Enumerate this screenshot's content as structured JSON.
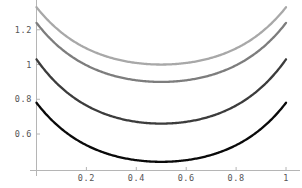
{
  "chart_data": {
    "type": "line",
    "title": "",
    "subtitle": "",
    "xlabel": "",
    "ylabel": "",
    "xlim": [
      0,
      1.04
    ],
    "ylim": [
      0.39,
      1.36
    ],
    "grid": false,
    "legend": null,
    "x_ticks": [
      0.2,
      0.4,
      0.6,
      0.8,
      1
    ],
    "x_tick_labels": [
      "0.2",
      "0.4",
      "0.6",
      "0.8",
      "1"
    ],
    "y_ticks": [
      0.6,
      0.8,
      1,
      1.2
    ],
    "y_tick_labels": [
      "0.6",
      "0.8",
      "1",
      "1.2"
    ],
    "x": [
      0,
      0.05,
      0.1,
      0.15,
      0.2,
      0.25,
      0.3,
      0.35,
      0.4,
      0.45,
      0.5,
      0.55,
      0.6,
      0.65,
      0.7,
      0.75,
      0.8,
      0.85,
      0.9,
      0.95,
      1
    ],
    "series": [
      {
        "name": "curve-1",
        "color": "#a8a8a8",
        "minimum_x": 0.5,
        "minimum_y": 1.0,
        "endpoint_y": 1.33,
        "values": [
          1.33,
          1.262,
          1.199,
          1.143,
          1.094,
          1.053,
          1.025,
          1.007,
          1.0,
          0.999,
          1.0,
          0.999,
          1.0,
          1.007,
          1.025,
          1.053,
          1.094,
          1.143,
          1.199,
          1.262,
          1.33
        ]
      },
      {
        "name": "curve-2",
        "color": "#7d7d7d",
        "minimum_x": 0.5,
        "minimum_y": 0.9,
        "endpoint_y": 1.24,
        "values": [
          1.24,
          1.166,
          1.1,
          1.042,
          0.993,
          0.953,
          0.925,
          0.907,
          0.9,
          0.899,
          0.9,
          0.899,
          0.9,
          0.907,
          0.925,
          0.953,
          0.993,
          1.042,
          1.1,
          1.166,
          1.24
        ]
      },
      {
        "name": "curve-3",
        "color": "#3c3c3c",
        "minimum_x": 0.5,
        "minimum_y": 0.66,
        "endpoint_y": 1.03,
        "values": [
          1.03,
          0.952,
          0.879,
          0.813,
          0.757,
          0.712,
          0.68,
          0.663,
          0.66,
          0.659,
          0.66,
          0.659,
          0.66,
          0.663,
          0.68,
          0.712,
          0.757,
          0.813,
          0.879,
          0.952,
          1.03
        ]
      },
      {
        "name": "curve-4",
        "color": "#0a0a0a",
        "minimum_x": 0.5,
        "minimum_y": 0.44,
        "endpoint_y": 0.78,
        "values": [
          0.78,
          0.709,
          0.645,
          0.589,
          0.542,
          0.503,
          0.473,
          0.452,
          0.44,
          0.439,
          0.44,
          0.439,
          0.44,
          0.452,
          0.473,
          0.503,
          0.542,
          0.589,
          0.645,
          0.709,
          0.78
        ]
      }
    ],
    "axis_color": "#b5b5b5",
    "tick_label_color": "#555555",
    "background": "#ffffff"
  }
}
